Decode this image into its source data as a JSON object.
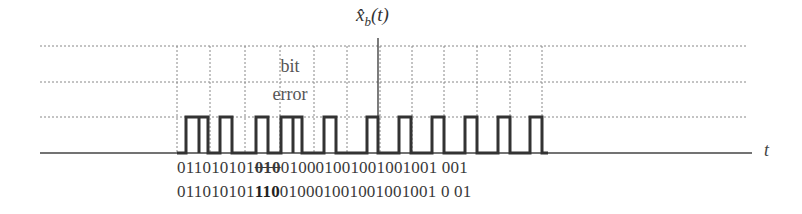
{
  "figure": {
    "signal_label": "x̂",
    "signal_subscript": "b",
    "signal_arg": "(t)",
    "annotation_line1": "bit",
    "annotation_line2": "error",
    "axis_label": "t",
    "colors": {
      "line": "#333333",
      "grid": "#888888",
      "background": "#ffffff"
    }
  },
  "bit_rows": [
    {
      "before": "011010101",
      "highlight": "010",
      "after": "01000100100100100 1 001",
      "highlight_style": "strikethrough"
    },
    {
      "before": "011010101",
      "highlight": "110",
      "after": "0100010010010010010 01",
      "highlight_style": "bold"
    }
  ],
  "bit_rows_display": {
    "row1_before": "011010101",
    "row1_highlight": "010",
    "row1_after": "010001001001001001 001",
    "row2_before": "011010101",
    "row2_highlight": "110",
    "row2_after": "010001001001001001 0 01"
  },
  "chart_data": {
    "type": "line",
    "xlabel": "t",
    "ylabel": "",
    "grid": true,
    "hlines_y_px": [
      46,
      82,
      117
    ],
    "axis_y_px": 153,
    "vlines_x_px": [
      177,
      210,
      245,
      280,
      314,
      347,
      380,
      412,
      444,
      477,
      510,
      542
    ],
    "pulses": [
      {
        "x0": 186,
        "x1": 199
      },
      {
        "x0": 199,
        "x1": 208
      },
      {
        "x0": 220,
        "x1": 232
      },
      {
        "x0": 256,
        "x1": 268
      },
      {
        "x0": 281,
        "x1": 293
      },
      {
        "x0": 293,
        "x1": 302
      },
      {
        "x0": 324,
        "x1": 336
      },
      {
        "x0": 367,
        "x1": 378
      },
      {
        "x0": 399,
        "x1": 411
      },
      {
        "x0": 432,
        "x1": 444
      },
      {
        "x0": 465,
        "x1": 477
      },
      {
        "x0": 498,
        "x1": 510
      },
      {
        "x0": 530,
        "x1": 542
      }
    ],
    "pulse_low_px": 153,
    "pulse_high_px": 117,
    "marker_x_px": 378,
    "sequence_received": "011010101 010 0100010010010010 01 001",
    "sequence_decoded": "011010101 110 0100010010010010010 01"
  }
}
